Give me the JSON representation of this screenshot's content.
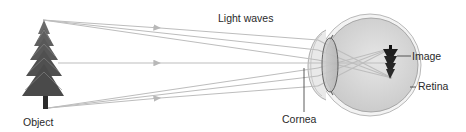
{
  "diagram": {
    "labels": {
      "light_waves": "Light waves",
      "object": "Object",
      "cornea": "Cornea",
      "image": "Image",
      "retina": "Retina"
    },
    "colors": {
      "ray": "#bdbdbd",
      "eye_fill": "#d6d6d6",
      "eye_outline": "#9a9a9a",
      "lens_fill": "#c4c4c4",
      "tree": "#555555",
      "image_tree": "#1e1e1e",
      "text": "#2a2a2a",
      "leader": "#333333"
    },
    "components": [
      "object-tree",
      "light-rays",
      "cornea",
      "lens",
      "eyeball",
      "retina",
      "inverted-image"
    ]
  }
}
